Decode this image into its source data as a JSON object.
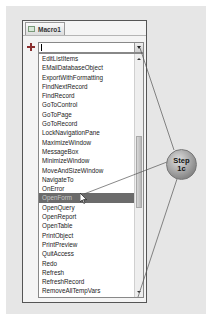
{
  "window": {
    "tab_label": "Macro1",
    "tab_icon": "macro-icon"
  },
  "action_combo": {
    "add_icon": "plus-icon",
    "value": "",
    "dropdown_icon": "chevron-down-icon"
  },
  "action_list": {
    "items": [
      "EditListItems",
      "EMailDatabaseObject",
      "ExportWithFormatting",
      "FindNextRecord",
      "FindRecord",
      "GoToControl",
      "GoToPage",
      "GoToRecord",
      "LockNavigationPane",
      "MaximizeWindow",
      "MessageBox",
      "MinimizeWindow",
      "MoveAndSizeWindow",
      "NavigateTo",
      "OnError",
      "OpenForm",
      "OpenQuery",
      "OpenReport",
      "OpenTable",
      "PrintObject",
      "PrintPreview",
      "QuitAccess",
      "Redo",
      "Refresh",
      "RefreshRecord",
      "RemoveAllTempVars",
      "RemoveFilterSort",
      "RemoveTempVar"
    ],
    "selected_index": 15,
    "selected_value": "OpenForm"
  },
  "callout": {
    "line1": "Step",
    "line2": "1c"
  },
  "colors": {
    "selection_bg": "#6b6b6b",
    "panel_bg": "#e6e6e6",
    "plus_icon": "#8a2e2e"
  }
}
